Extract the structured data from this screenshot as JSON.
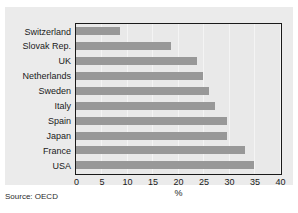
{
  "figure": {
    "caption_sliver": "",
    "source_note": "Source: OECD"
  },
  "chart_data": {
    "type": "bar",
    "orientation": "horizontal",
    "title": "",
    "subtitle": "",
    "xlabel": "%",
    "ylabel": "",
    "xlim": [
      0,
      40
    ],
    "xticks": [
      0,
      5,
      10,
      15,
      20,
      25,
      30,
      35,
      40
    ],
    "xticklabels": [
      "0",
      "5",
      "10",
      "15",
      "20",
      "25",
      "30",
      "35",
      "40"
    ],
    "grid": true,
    "legend": null,
    "categories": [
      "Switzerland",
      "Slovak Rep.",
      "UK",
      "Netherlands",
      "Sweden",
      "Italy",
      "Spain",
      "Japan",
      "France",
      "USA"
    ],
    "values": [
      8.6,
      18.7,
      23.8,
      25.0,
      26.2,
      27.3,
      29.6,
      29.6,
      33.1,
      34.9
    ],
    "bar_color": "#989898",
    "plot_background": "#e9e9e9",
    "panel_background": "#ebebeb",
    "frame_color": "#1a1a1a",
    "gridline_color": "#f4f4f4"
  }
}
